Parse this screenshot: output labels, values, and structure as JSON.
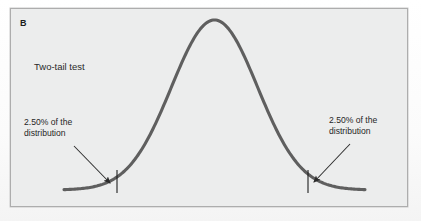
{
  "figure": {
    "panel_label": "B",
    "test_type_label": "Two-tail test",
    "annotations": {
      "left": "2.50% of the distribution",
      "right": "2.50% of the distribution"
    },
    "annotation_lines": {
      "left_line_1": "2.50% of the",
      "left_line_2": "distribution",
      "right_line_1": "2.50% of the",
      "right_line_2": "distribution"
    },
    "colors": {
      "curve": "#5f5f5f",
      "panel_background": "#eceded",
      "panel_border": "#adadad",
      "text": "#262626",
      "arrow": "#2b2b2b",
      "tick": "#1f1f1f"
    }
  },
  "chart_data": {
    "type": "line",
    "title": "Two-tail test",
    "subtitle": "B",
    "xlabel": "",
    "ylabel": "",
    "distribution": "normal",
    "grid": false,
    "legend": false,
    "axis_visible": false,
    "mean": 0,
    "sd": 1,
    "significance_level_total_percent": 5.0,
    "tails": [
      {
        "side": "left",
        "area_percent": 2.5,
        "label": "2.50% of the distribution",
        "critical_z": -1.96,
        "critical_x_px": 117
      },
      {
        "side": "right",
        "area_percent": 2.5,
        "label": "2.50% of the distribution",
        "critical_z": 1.96,
        "critical_x_px": 308
      }
    ],
    "curve_geometry": {
      "peak_x_px": 212,
      "peak_y_px": 20,
      "baseline_y_px": 190,
      "left_end_x_px": 64,
      "right_end_x_px": 365
    },
    "x": [
      -3.5,
      -3.0,
      -2.5,
      -2.0,
      -1.5,
      -1.0,
      -0.5,
      0,
      0.5,
      1.0,
      1.5,
      2.0,
      2.5,
      3.0,
      3.5
    ],
    "y": [
      0.0009,
      0.0044,
      0.0175,
      0.054,
      0.1295,
      0.242,
      0.3521,
      0.3989,
      0.3521,
      0.242,
      0.1295,
      0.054,
      0.0175,
      0.0044,
      0.0009
    ]
  }
}
